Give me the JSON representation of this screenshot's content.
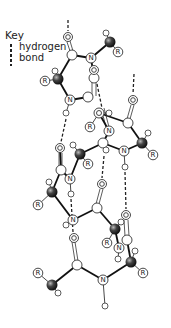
{
  "key": {
    "title": "Key",
    "line1": "hydrogen",
    "line2": "bond"
  },
  "labels": {
    "R": "R",
    "N": "N",
    "O": "O"
  },
  "colors": {
    "bond": "#111111",
    "carbon_alpha": "#3a3a3a",
    "atom_outline": "#333333",
    "atom_fill": "#ffffff"
  }
}
